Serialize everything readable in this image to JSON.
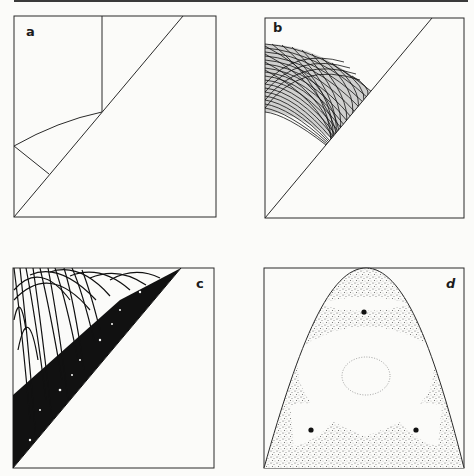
{
  "figure": {
    "panels": [
      {
        "id": "a",
        "label": "a",
        "description": "Triangular billiard domain with diagonal boundary, vertical line, arc and short segment"
      },
      {
        "id": "b",
        "label": "b",
        "description": "Dense family of arc trajectories in a band near the upper-left, bounded by the diagonal"
      },
      {
        "id": "c",
        "label": "c",
        "description": "Chaotic trajectory filling the upper-left triangle below the diagonal"
      },
      {
        "id": "d",
        "label": "d",
        "description": "Poincaré section: stippled chaotic sea inside a parabolic envelope with regular islands and three fixed points"
      }
    ]
  },
  "colors": {
    "ink": "#1c1c1c",
    "paper": "#fbfbf9",
    "stipple": "#6a6a6a"
  }
}
